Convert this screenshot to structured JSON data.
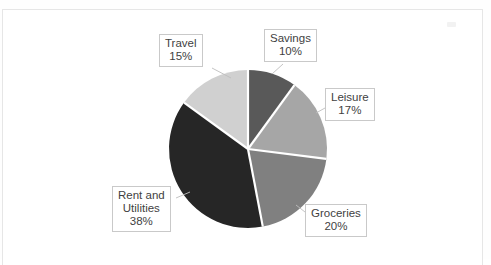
{
  "document": {
    "type": "scanned-page",
    "background_color": "#ffffff",
    "frame_color": "#e6e6e6"
  },
  "chart_data": {
    "type": "pie",
    "title": "",
    "subtitle": "",
    "xlabel": "",
    "ylabel": "",
    "legend_position": "none",
    "grid": false,
    "labels_outside": true,
    "start_angle_deg": 0,
    "direction": "clockwise",
    "categories": [
      "Savings",
      "Leisure",
      "Groceries",
      "Rent and Utilities",
      "Travel"
    ],
    "values": [
      10,
      17,
      20,
      38,
      15
    ],
    "value_unit": "%",
    "colors": [
      "#595959",
      "#a6a6a6",
      "#808080",
      "#262626",
      "#d0d0d0"
    ],
    "separator_color": "#ffffff",
    "slices": [
      {
        "name": "Savings",
        "value": 10,
        "label_text": "Savings",
        "value_text": "10%",
        "color": "#595959",
        "start_angle_deg": 0,
        "end_angle_deg": 36
      },
      {
        "name": "Leisure",
        "value": 17,
        "label_text": "Leisure",
        "value_text": "17%",
        "color": "#a6a6a6",
        "start_angle_deg": 36,
        "end_angle_deg": 97.2
      },
      {
        "name": "Groceries",
        "value": 20,
        "label_text": "Groceries",
        "value_text": "20%",
        "color": "#808080",
        "start_angle_deg": 97.2,
        "end_angle_deg": 169.2
      },
      {
        "name": "Rent and Utilities",
        "value": 38,
        "label_line_1": "Rent and",
        "label_line_2": "Utilities",
        "value_text": "38%",
        "color": "#262626",
        "start_angle_deg": 169.2,
        "end_angle_deg": 306
      },
      {
        "name": "Travel",
        "value": 15,
        "label_text": "Travel",
        "value_text": "15%",
        "color": "#d0d0d0",
        "start_angle_deg": 306,
        "end_angle_deg": 360
      }
    ]
  }
}
